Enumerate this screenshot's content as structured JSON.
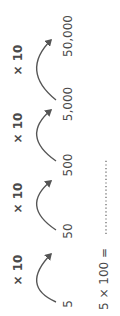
{
  "sequence": {
    "numbers": [
      "5",
      "50",
      "500",
      "5,000",
      "50,000"
    ],
    "operators": [
      "× 10",
      "× 10",
      "× 10",
      "× 10"
    ]
  },
  "question": {
    "text": "5 × 100 =",
    "answer": ""
  },
  "colors": {
    "ink": "#4a4a4a",
    "arrow": "#555555"
  }
}
